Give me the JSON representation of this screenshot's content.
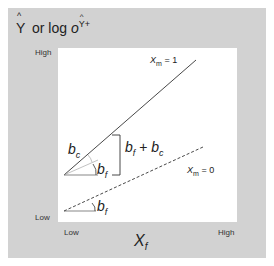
{
  "figure": {
    "y_axis_label": {
      "y_hat": "Y",
      "hat": "^",
      "or_text": "or log",
      "odds_symbol": "o",
      "odds_sub": "Y+",
      "full_text": "Ŷ or log o(Ŷ+)"
    },
    "y_ticks": {
      "high": "High",
      "low": "Low"
    },
    "x_axis_label": {
      "symbol": "X",
      "sub": "f"
    },
    "x_ticks": {
      "low": "Low",
      "high": "High"
    },
    "lines": [
      {
        "name": "Xm = 1",
        "label_symbol": "X",
        "label_sub": "m",
        "label_value": "= 1",
        "style": "solid"
      },
      {
        "name": "Xm = 0",
        "label_symbol": "X",
        "label_sub": "m",
        "label_value": "= 0",
        "style": "dashed"
      }
    ],
    "angle_labels": {
      "upper_bc": {
        "symbol": "b",
        "sub": "c"
      },
      "upper_bf": {
        "symbol": "b",
        "sub": "f"
      },
      "lower_bf": {
        "symbol": "b",
        "sub": "f"
      },
      "bracket": {
        "b1": "b",
        "s1": "f",
        "plus": " + ",
        "b2": "b",
        "s2": "c"
      }
    },
    "colors": {
      "frame": "#d2d2d2",
      "plot": "#ffffff",
      "line": "#333333"
    }
  }
}
